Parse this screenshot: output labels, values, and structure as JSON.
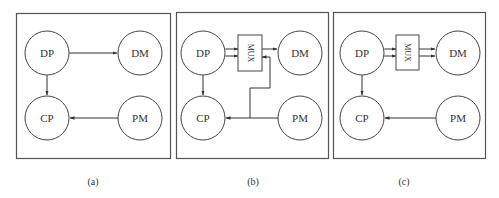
{
  "figure": {
    "panels": [
      {
        "id": "a",
        "caption": "(a)",
        "nodes": {
          "dp": "DP",
          "dm": "DM",
          "cp": "CP",
          "pm": "PM"
        },
        "has_mux": false,
        "edges": [
          "DP<->DM",
          "DP<->CP",
          "PM->CP"
        ]
      },
      {
        "id": "b",
        "caption": "(b)",
        "nodes": {
          "dp": "DP",
          "dm": "DM",
          "cp": "CP",
          "pm": "PM"
        },
        "has_mux": true,
        "mux_label": "MUX",
        "edges": [
          "DP<=>MUX (2 lines)",
          "MUX<->DM",
          "DP<->CP",
          "PM->CP",
          "PM/CP line->MUX"
        ]
      },
      {
        "id": "c",
        "caption": "(c)",
        "nodes": {
          "dp": "DP",
          "dm": "DM",
          "cp": "CP",
          "pm": "PM"
        },
        "has_mux": true,
        "mux_label": "MUX",
        "edges": [
          "DP<=>MUX (2 lines)",
          "MUX<=>DM (2 lines)",
          "DP<->CP",
          "PM->CP"
        ]
      }
    ]
  }
}
